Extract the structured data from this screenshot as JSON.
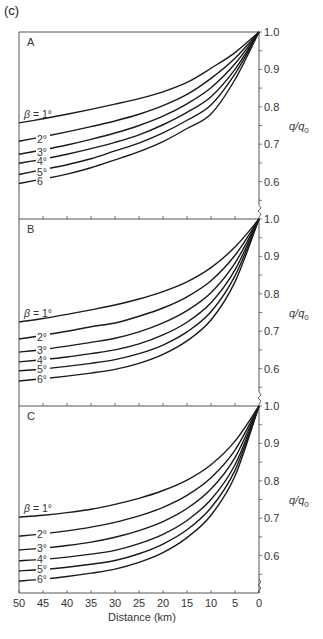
{
  "figure": {
    "label": "(c)",
    "xlabel": "Distance (km)",
    "ylabel": "q/q",
    "ylabel_sub": "0"
  },
  "chart_data": {
    "type": "line",
    "title": "",
    "xlabel": "Distance (km)",
    "ylabel": "q/q0",
    "x": [
      50,
      45,
      40,
      35,
      30,
      25,
      20,
      15,
      10,
      5,
      0
    ],
    "xlim": [
      50,
      0
    ],
    "ylim": [
      0.5,
      1.0
    ],
    "x_ticks": [
      "50",
      "45",
      "40",
      "35",
      "30",
      "25",
      "20",
      "15",
      "10",
      "5",
      "0"
    ],
    "y_ticks": [
      "1.0",
      "0.9",
      "0.8",
      "0.7",
      "0.6"
    ],
    "grid": false,
    "panels": [
      {
        "name": "A",
        "series": [
          {
            "name": "β = 1°",
            "label": "β = 1°",
            "values": [
              0.757,
              0.768,
              0.78,
              0.793,
              0.807,
              0.822,
              0.84,
              0.865,
              0.903,
              0.945,
              1.0
            ]
          },
          {
            "name": "2°",
            "label": "2°",
            "values": [
              0.708,
              0.72,
              0.733,
              0.747,
              0.762,
              0.78,
              0.803,
              0.833,
              0.876,
              0.93,
              1.0
            ]
          },
          {
            "name": "3°",
            "label": "3°",
            "values": [
              0.673,
              0.685,
              0.698,
              0.713,
              0.73,
              0.75,
              0.775,
              0.808,
              0.851,
              0.915,
              1.0
            ]
          },
          {
            "name": "4°",
            "label": "4°",
            "values": [
              0.649,
              0.66,
              0.673,
              0.688,
              0.705,
              0.725,
              0.752,
              0.785,
              0.827,
              0.9,
              1.0
            ]
          },
          {
            "name": "5°",
            "label": "5°",
            "values": [
              0.619,
              0.632,
              0.645,
              0.661,
              0.682,
              0.703,
              0.73,
              0.764,
              0.805,
              0.888,
              1.0
            ]
          },
          {
            "name": "6",
            "label": "6",
            "values": [
              0.595,
              0.607,
              0.62,
              0.637,
              0.658,
              0.68,
              0.707,
              0.742,
              0.781,
              0.873,
              1.0
            ]
          }
        ]
      },
      {
        "name": "B",
        "series": [
          {
            "name": "β = 1°",
            "label": "β = 1°",
            "values": [
              0.725,
              0.734,
              0.745,
              0.757,
              0.77,
              0.786,
              0.806,
              0.832,
              0.87,
              0.925,
              1.0
            ]
          },
          {
            "name": "2°",
            "label": "2°",
            "values": [
              0.679,
              0.689,
              0.7,
              0.712,
              0.722,
              0.74,
              0.762,
              0.792,
              0.835,
              0.903,
              1.0
            ]
          },
          {
            "name": "3°",
            "label": "3°",
            "values": [
              0.644,
              0.651,
              0.66,
              0.67,
              0.681,
              0.698,
              0.722,
              0.755,
              0.803,
              0.882,
              1.0
            ]
          },
          {
            "name": "4°",
            "label": "4°",
            "values": [
              0.618,
              0.624,
              0.631,
              0.64,
              0.65,
              0.666,
              0.69,
              0.724,
              0.776,
              0.864,
              1.0
            ]
          },
          {
            "name": "5°",
            "label": "5°",
            "values": [
              0.594,
              0.599,
              0.606,
              0.614,
              0.624,
              0.64,
              0.663,
              0.698,
              0.752,
              0.848,
              1.0
            ]
          },
          {
            "name": "6°",
            "label": "6°",
            "values": [
              0.567,
              0.573,
              0.58,
              0.588,
              0.598,
              0.614,
              0.638,
              0.674,
              0.73,
              0.832,
              1.0
            ]
          }
        ]
      },
      {
        "name": "C",
        "series": [
          {
            "name": "β = 1°",
            "label": "β = 1°",
            "values": [
              0.703,
              0.708,
              0.715,
              0.724,
              0.737,
              0.753,
              0.774,
              0.802,
              0.843,
              0.906,
              1.0
            ]
          },
          {
            "name": "2°",
            "label": "2°",
            "values": [
              0.652,
              0.658,
              0.666,
              0.676,
              0.689,
              0.706,
              0.729,
              0.761,
              0.808,
              0.882,
              1.0
            ]
          },
          {
            "name": "3°",
            "label": "3°",
            "values": [
              0.615,
              0.62,
              0.627,
              0.636,
              0.649,
              0.667,
              0.691,
              0.726,
              0.778,
              0.862,
              1.0
            ]
          },
          {
            "name": "4°",
            "label": "4°",
            "values": [
              0.586,
              0.59,
              0.596,
              0.604,
              0.614,
              0.632,
              0.657,
              0.694,
              0.75,
              0.843,
              1.0
            ]
          },
          {
            "name": "5°",
            "label": "5°",
            "values": [
              0.559,
              0.563,
              0.569,
              0.577,
              0.587,
              0.605,
              0.631,
              0.669,
              0.728,
              0.828,
              1.0
            ]
          },
          {
            "name": "6°",
            "label": "6°",
            "values": [
              0.532,
              0.537,
              0.544,
              0.553,
              0.564,
              0.582,
              0.608,
              0.648,
              0.708,
              0.813,
              1.0
            ]
          }
        ]
      }
    ]
  },
  "colors": {
    "line": "#1a1a1a",
    "axis": "#555555",
    "text": "#333333"
  }
}
